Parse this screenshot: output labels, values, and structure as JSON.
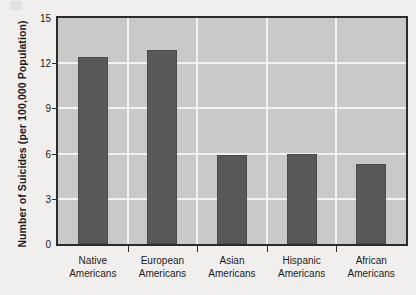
{
  "chart_data": {
    "type": "bar",
    "title": "",
    "xlabel": "",
    "ylabel": "Number of Suicides (per 100,000 Population)",
    "categories": [
      "Native Americans",
      "European Americans",
      "Asian Americans",
      "Hispanic Americans",
      "African Americans"
    ],
    "category_lines": [
      [
        "Native",
        "Americans"
      ],
      [
        "European",
        "Americans"
      ],
      [
        "Asian",
        "Americans"
      ],
      [
        "Hispanic",
        "Americans"
      ],
      [
        "African",
        "Americans"
      ]
    ],
    "values": [
      12.4,
      12.9,
      5.9,
      6.0,
      5.3
    ],
    "ylim": [
      0,
      15
    ],
    "yticks": [
      0,
      3,
      6,
      9,
      12,
      15
    ],
    "ytick_labels": [
      "0",
      "3",
      "6",
      "9",
      "12",
      "15"
    ],
    "grid": "horizontal and vertical white gridlines",
    "legend": "none",
    "bar_color": "#595959",
    "plot_background": "#c9c9c9",
    "gridline_color": "#f2f2f2",
    "axis_color": "#2b2b2b",
    "page_background": "#f1efed"
  }
}
